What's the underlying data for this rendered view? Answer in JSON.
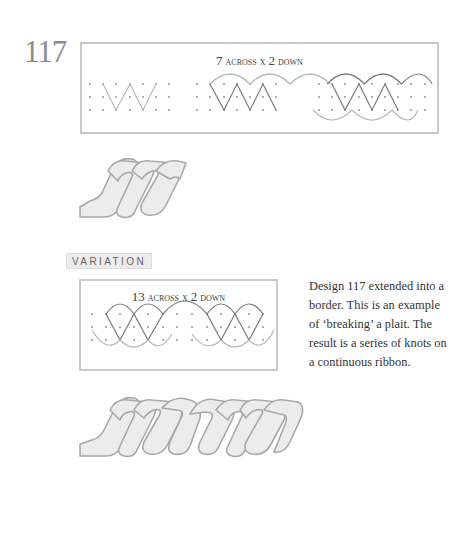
{
  "page": {
    "design_number": "117",
    "main_grid": {
      "title_num_across": "7",
      "title_across": "across x",
      "title_num_down": "2",
      "title_down": "down",
      "title": "7 across x 2 down",
      "panels": [
        "dot-grid-with-zigzag",
        "dot-grid-with-zigzag-and-top-arcs",
        "dot-grid-with-zigzag-and-top-bottom-arcs"
      ]
    },
    "variation": {
      "label": "VARIATION",
      "grid": {
        "title_num_across": "13",
        "title_across": "across x",
        "title_num_down": "2",
        "title_down": "down",
        "title": "13 across x 2 down"
      },
      "description": "Design 117 extended into a border. This is an example of ‘breaking’ a plait. The result is a series of knots on a continuous ribbon."
    },
    "colors": {
      "line_dark": "#7a7a7a",
      "line_light": "#b4b4b4",
      "dot": "#8a8a8a",
      "ribbon_fill": "#ececec",
      "ribbon_stroke": "#a8a8a8",
      "border": "#c9c9c9"
    }
  }
}
